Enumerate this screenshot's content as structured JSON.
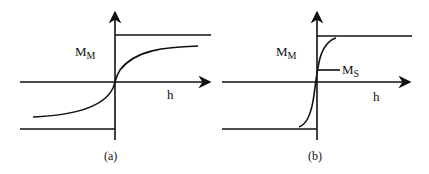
{
  "panels": [
    {
      "id": "a",
      "caption": "(a)",
      "y_label_main": "M",
      "y_label_sub": "M",
      "x_label": "h"
    },
    {
      "id": "b",
      "caption": "(b)",
      "y_label_main": "M",
      "y_label_sub": "M",
      "x_label": "h",
      "marker_main": "M",
      "marker_sub": "S"
    }
  ],
  "colors": {
    "line": "#111111",
    "background": "#ffffff"
  }
}
